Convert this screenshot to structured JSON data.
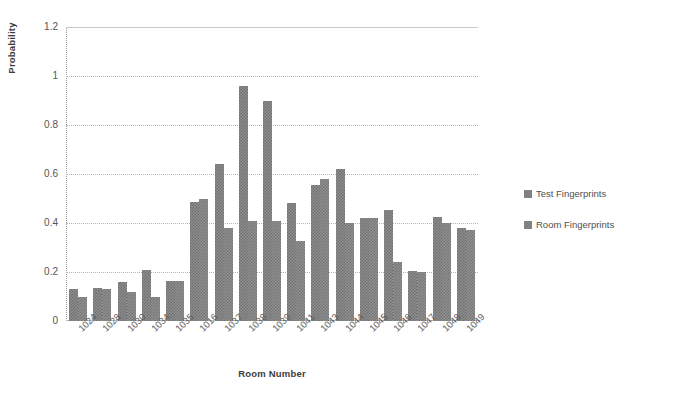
{
  "chart_data": {
    "type": "bar",
    "title": "",
    "xlabel": "Room Number",
    "ylabel": "Probability",
    "ylim": [
      0,
      1.2
    ],
    "yticks": [
      "0",
      "0.2",
      "0.4",
      "0.6",
      "0.8",
      "1",
      "1.2"
    ],
    "grid": true,
    "legend_position": "right",
    "categories": [
      "1024",
      "1028",
      "1030",
      "1034",
      "1035",
      "1016",
      "1037",
      "1038",
      "1039",
      "1041",
      "1043",
      "1044",
      "1045",
      "1046",
      "1047",
      "1048",
      "1049"
    ],
    "series": [
      {
        "name": "Test Fingerprints",
        "values": [
          0.13,
          0.135,
          0.16,
          0.21,
          0.165,
          0.485,
          0.64,
          0.96,
          0.9,
          0.48,
          0.555,
          0.62,
          0.42,
          0.455,
          0.205,
          0.425,
          0.38
        ]
      },
      {
        "name": "Room Fingerprints",
        "values": [
          0.1,
          0.13,
          0.12,
          0.1,
          0.165,
          0.5,
          0.38,
          0.41,
          0.41,
          0.325,
          0.58,
          0.4,
          0.42,
          0.24,
          0.2,
          0.4,
          0.37
        ]
      }
    ]
  },
  "colors": {
    "bar_fill": "#8c8c8c",
    "bar_pattern": "#6f6f6f",
    "gridline": "#b5b5b5",
    "axis": "#b9b9b9",
    "text": "#4f4f4f"
  },
  "legend": {
    "items": [
      {
        "label": "Test Fingerprints"
      },
      {
        "label": "Room Fingerprints"
      }
    ]
  }
}
